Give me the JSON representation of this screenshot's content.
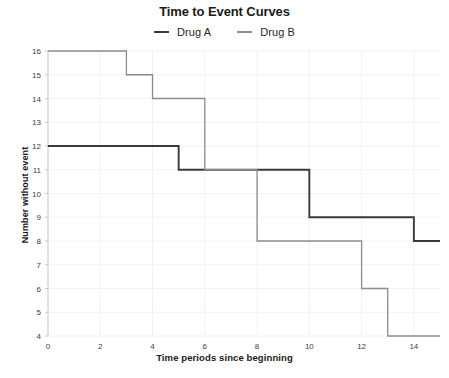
{
  "chart_data": {
    "type": "line",
    "title": "Time to Event Curves",
    "xlabel": "Time periods since beginning",
    "ylabel": "Number without event",
    "xlim": [
      0,
      15
    ],
    "ylim": [
      4,
      16
    ],
    "xticks": [
      0,
      2,
      4,
      6,
      8,
      10,
      12,
      14
    ],
    "yticks": [
      4,
      5,
      6,
      7,
      8,
      9,
      10,
      11,
      12,
      13,
      14,
      15,
      16
    ],
    "grid": true,
    "legend_position": "top-center",
    "step_style": "post",
    "series": [
      {
        "name": "Drug A",
        "color": "#3a3a3a",
        "x": [
          0,
          5,
          10,
          14,
          15
        ],
        "y": [
          12,
          11,
          9,
          8,
          8
        ]
      },
      {
        "name": "Drug B",
        "color": "#8c8c8c",
        "x": [
          0,
          3,
          4,
          6,
          8,
          12,
          13,
          15
        ],
        "y": [
          16,
          15,
          14,
          11,
          8,
          6,
          4,
          4
        ]
      }
    ]
  },
  "colors": {
    "background": "#ffffff",
    "grid": "#f2f2f2",
    "axis": "#c9c9c9",
    "text": "#1a1a1a",
    "drug_a": "#3a3a3a",
    "drug_b": "#8c8c8c"
  }
}
